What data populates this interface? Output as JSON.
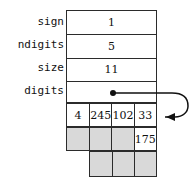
{
  "diagram": {
    "struct": {
      "fields": [
        {
          "label": "sign",
          "value": "1"
        },
        {
          "label": "ndigits",
          "value": "5"
        },
        {
          "label": "size",
          "value": "11"
        },
        {
          "label": "digits",
          "value": ""
        }
      ]
    },
    "array": {
      "rows": [
        {
          "name": "array-row-top",
          "cells": [
            {
              "value": "4",
              "state": "filled"
            },
            {
              "value": "245",
              "state": "filled"
            },
            {
              "value": "102",
              "state": "filled"
            },
            {
              "value": "33",
              "state": "filled"
            }
          ]
        },
        {
          "name": "array-row-middle",
          "cells": [
            {
              "value": "",
              "state": "empty"
            },
            {
              "value": "",
              "state": "empty"
            },
            {
              "value": "",
              "state": "empty"
            },
            {
              "value": "175",
              "state": "filled"
            }
          ]
        },
        {
          "name": "array-row-bottom",
          "cells": [
            {
              "value": "",
              "state": "empty"
            },
            {
              "value": "",
              "state": "empty"
            },
            {
              "value": "",
              "state": "empty"
            }
          ]
        }
      ]
    },
    "pointer": {
      "icon": "pointer-dot-icon",
      "arrow_icon": "curved-arrow-icon",
      "target_cell": "33"
    },
    "colors": {
      "line": "#2b2b2b",
      "text": "#111111",
      "empty_cell": "#d9d9d9",
      "filled_cell": "#ffffff",
      "background": "#ffffff"
    }
  }
}
